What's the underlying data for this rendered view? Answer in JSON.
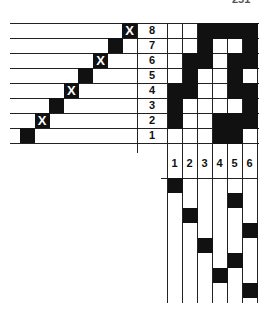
{
  "page_number": "251",
  "draft": {
    "shafts": 8,
    "treadles": 6,
    "row_labels": [
      "8",
      "7",
      "6",
      "5",
      "4",
      "3",
      "2",
      "1"
    ],
    "column_labels": [
      "1",
      "2",
      "3",
      "4",
      "5",
      "6"
    ],
    "threading": [
      {
        "shaft": 8,
        "position": 8,
        "mark": "X"
      },
      {
        "shaft": 7,
        "position": 7,
        "mark": "solid"
      },
      {
        "shaft": 6,
        "position": 6,
        "mark": "X"
      },
      {
        "shaft": 5,
        "position": 5,
        "mark": "solid"
      },
      {
        "shaft": 4,
        "position": 4,
        "mark": "X"
      },
      {
        "shaft": 3,
        "position": 3,
        "mark": "solid"
      },
      {
        "shaft": 2,
        "position": 2,
        "mark": "X"
      },
      {
        "shaft": 1,
        "position": 1,
        "mark": "solid"
      }
    ],
    "threading_x_mark": "X",
    "tieup": {
      "8": [
        0,
        0,
        1,
        1,
        1,
        1
      ],
      "7": [
        0,
        0,
        1,
        0,
        0,
        1
      ],
      "6": [
        0,
        1,
        1,
        0,
        1,
        1
      ],
      "5": [
        0,
        1,
        0,
        0,
        1,
        0
      ],
      "4": [
        1,
        1,
        0,
        0,
        1,
        1
      ],
      "3": [
        1,
        0,
        0,
        0,
        0,
        1
      ],
      "2": [
        1,
        0,
        0,
        1,
        1,
        1
      ],
      "1": [
        0,
        0,
        0,
        1,
        1,
        0
      ]
    },
    "treadling": [
      1,
      5,
      2,
      6,
      3,
      5,
      4,
      6
    ]
  }
}
